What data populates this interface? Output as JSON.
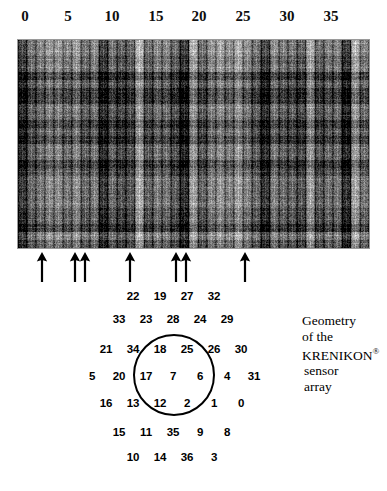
{
  "figure": {
    "axis": {
      "ticks": [
        {
          "label": "0",
          "x": 25
        },
        {
          "label": "5",
          "x": 68
        },
        {
          "label": "10",
          "x": 112
        },
        {
          "label": "15",
          "x": 156
        },
        {
          "label": "20",
          "x": 199
        },
        {
          "label": "25",
          "x": 243
        },
        {
          "label": "30",
          "x": 287
        },
        {
          "label": "35",
          "x": 331
        }
      ]
    },
    "raster": {
      "name": "krenikon-sensor-raster-image",
      "left": 18,
      "top": 40,
      "width": 351,
      "height": 208,
      "background_color": "#1b1b1b",
      "description": "dense grayscale striped raster of sensor channel data"
    },
    "arrows": [
      {
        "x": 42,
        "y": 252
      },
      {
        "x": 75,
        "y": 252
      },
      {
        "x": 85,
        "y": 252
      },
      {
        "x": 130,
        "y": 252
      },
      {
        "x": 176,
        "y": 252
      },
      {
        "x": 186,
        "y": 252
      },
      {
        "x": 245,
        "y": 252
      }
    ],
    "sensor_map": {
      "circle": {
        "cx": 174,
        "cy": 375,
        "r": 41,
        "color": "#000000"
      },
      "rows": [
        {
          "y": 296,
          "cells": [
            {
              "label": "22",
              "x": 133
            },
            {
              "label": "19",
              "x": 160
            },
            {
              "label": "27",
              "x": 187
            },
            {
              "label": "32",
              "x": 214
            }
          ]
        },
        {
          "y": 319,
          "cells": [
            {
              "label": "33",
              "x": 119
            },
            {
              "label": "23",
              "x": 146
            },
            {
              "label": "28",
              "x": 173
            },
            {
              "label": "24",
              "x": 200
            },
            {
              "label": "29",
              "x": 227
            }
          ]
        },
        {
          "y": 349,
          "cells": [
            {
              "label": "21",
              "x": 106
            },
            {
              "label": "34",
              "x": 133
            },
            {
              "label": "18",
              "x": 160
            },
            {
              "label": "25",
              "x": 187
            },
            {
              "label": "26",
              "x": 214
            },
            {
              "label": "30",
              "x": 241
            }
          ]
        },
        {
          "y": 376,
          "cells": [
            {
              "label": "5",
              "x": 92
            },
            {
              "label": "20",
              "x": 119
            },
            {
              "label": "17",
              "x": 146
            },
            {
              "label": "7",
              "x": 173
            },
            {
              "label": "6",
              "x": 200
            },
            {
              "label": "4",
              "x": 227
            },
            {
              "label": "31",
              "x": 254
            }
          ]
        },
        {
          "y": 403,
          "cells": [
            {
              "label": "16",
              "x": 106
            },
            {
              "label": "13",
              "x": 133
            },
            {
              "label": "12",
              "x": 160
            },
            {
              "label": "2",
              "x": 187
            },
            {
              "label": "1",
              "x": 214
            },
            {
              "label": "0",
              "x": 241
            }
          ]
        },
        {
          "y": 432,
          "cells": [
            {
              "label": "15",
              "x": 119
            },
            {
              "label": "11",
              "x": 146
            },
            {
              "label": "35",
              "x": 173
            },
            {
              "label": "9",
              "x": 200
            },
            {
              "label": "8",
              "x": 227
            }
          ]
        },
        {
          "y": 457,
          "cells": [
            {
              "label": "10",
              "x": 133
            },
            {
              "label": "14",
              "x": 160
            },
            {
              "label": "36",
              "x": 187
            },
            {
              "label": "3",
              "x": 214
            }
          ]
        }
      ]
    },
    "caption": {
      "line1": "Geometry",
      "line2": "of the",
      "line3_main": "KRENIKON",
      "line3_mark": "®",
      "line4": "sensor",
      "line5": "array"
    }
  },
  "chart_data": {
    "type": "heatmap",
    "title": "Geometry of the KRENIKON® sensor array",
    "xlabel": "",
    "ylabel": "",
    "xlim": [
      0,
      36
    ],
    "xticks": [
      0,
      5,
      10,
      15,
      20,
      25,
      30,
      35
    ],
    "grid": false,
    "legend": "none",
    "annotations": {
      "arrow_channels": [
        2,
        9,
        10,
        15,
        21,
        22,
        29
      ],
      "note": "arrows mark selected sensor channels beneath the raster strip"
    },
    "sensor_layout_rows": [
      [
        22,
        19,
        27,
        32
      ],
      [
        33,
        23,
        28,
        24,
        29
      ],
      [
        21,
        34,
        18,
        25,
        26,
        30
      ],
      [
        5,
        20,
        17,
        7,
        6,
        4,
        31
      ],
      [
        16,
        13,
        12,
        2,
        1,
        0
      ],
      [
        15,
        11,
        35,
        9,
        8
      ],
      [
        10,
        14,
        36,
        3
      ]
    ],
    "inner_circle_sensors": [
      18,
      25,
      17,
      7,
      6,
      12,
      2
    ]
  }
}
